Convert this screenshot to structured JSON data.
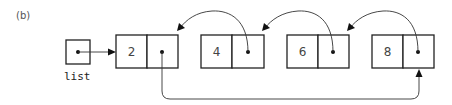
{
  "figure": {
    "label": "(b)",
    "variable_label": "list",
    "nodes": [
      {
        "value": "2"
      },
      {
        "value": "4"
      },
      {
        "value": "6"
      },
      {
        "value": "8"
      }
    ]
  }
}
